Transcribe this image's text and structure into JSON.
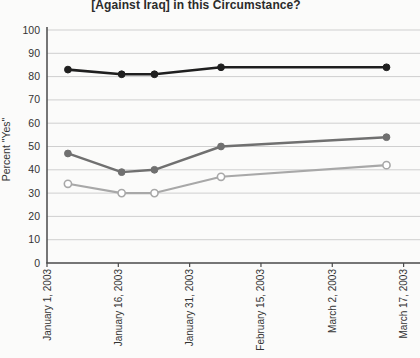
{
  "chart_data": {
    "type": "line",
    "title": "[Against Iraq] in this Circumstance?",
    "ylabel": "Percent \"Yes\"",
    "xlabel": "",
    "ylim": [
      0,
      100
    ],
    "y_ticks": [
      0,
      10,
      20,
      30,
      40,
      50,
      60,
      70,
      80,
      90,
      100
    ],
    "x_ticks": [
      {
        "label": "January 1, 2003",
        "day": 0
      },
      {
        "label": "January 16, 2003",
        "day": 15
      },
      {
        "label": "January 31, 2003",
        "day": 30
      },
      {
        "label": "February 15, 2003",
        "day": 45
      },
      {
        "label": "March 2, 2003",
        "day": 60
      },
      {
        "label": "March 17, 2003",
        "day": 75
      }
    ],
    "xlim_days": [
      0,
      78.5
    ],
    "grid": true,
    "legend_position": "none",
    "grid_color": "#cfcfcf",
    "axis_color": "#4a4a4a",
    "text_color": "#333333",
    "series": [
      {
        "name": "dark-series",
        "color": "#1f1f1f",
        "marker": "filled-circle",
        "line_width": 2.6,
        "x_days": [
          4.4,
          15.7,
          22.6,
          36.6,
          71.4
        ],
        "values": [
          83,
          81,
          81,
          84,
          84
        ]
      },
      {
        "name": "medium-gray-series",
        "color": "#707070",
        "marker": "filled-circle",
        "line_width": 2.4,
        "x_days": [
          4.4,
          15.7,
          22.6,
          36.6,
          71.4
        ],
        "values": [
          47,
          39,
          40,
          50,
          54
        ]
      },
      {
        "name": "light-gray-series",
        "color": "#a8a8a8",
        "marker": "open-circle",
        "line_width": 2.1,
        "x_days": [
          4.4,
          15.7,
          22.6,
          36.6,
          71.4
        ],
        "values": [
          34,
          30,
          30,
          37,
          42
        ]
      }
    ]
  }
}
